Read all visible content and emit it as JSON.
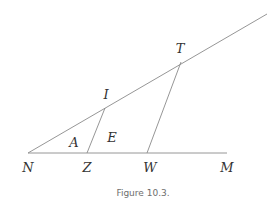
{
  "figure": {
    "caption": "Figure 10.3.",
    "line_color": "#8a8a8a",
    "label_color": "#333333",
    "caption_color": "#6e6e6e"
  },
  "points": {
    "N": {
      "label": "N",
      "x": 28,
      "y": 153
    },
    "Z": {
      "label": "Z",
      "x": 87,
      "y": 153
    },
    "W": {
      "label": "W",
      "x": 147,
      "y": 153
    },
    "M": {
      "label": "M",
      "x": 227,
      "y": 153
    },
    "I": {
      "label": "I",
      "x": 105,
      "y": 108
    },
    "T": {
      "label": "T",
      "x": 181,
      "y": 62
    }
  },
  "regions": {
    "A": {
      "label": "A"
    },
    "E": {
      "label": "E"
    }
  },
  "segments": [
    {
      "from": "N",
      "to": "M"
    },
    {
      "from": "N",
      "to": "ray-end"
    },
    {
      "from": "Z",
      "to": "I"
    },
    {
      "from": "W",
      "to": "T"
    }
  ]
}
